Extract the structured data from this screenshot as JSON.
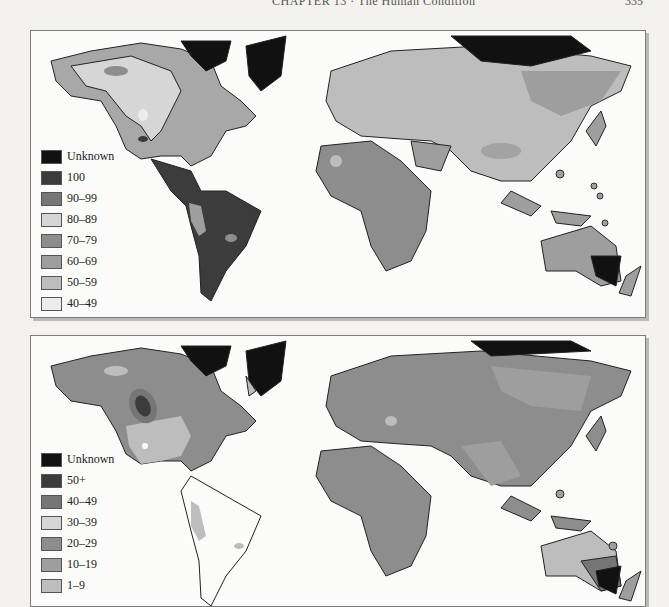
{
  "running_head": {
    "title": "CHAPTER 13 · The Human Condition",
    "page_number": "335"
  },
  "maps": [
    {
      "id": "top",
      "legend": [
        {
          "label": "Unknown",
          "color": "#111111"
        },
        {
          "label": "100",
          "color": "#3c3c3c"
        },
        {
          "label": "90–99",
          "color": "#767676"
        },
        {
          "label": "80–89",
          "color": "#d6d6d6"
        },
        {
          "label": "70–79",
          "color": "#8d8d8d"
        },
        {
          "label": "60–69",
          "color": "#9e9e9e"
        },
        {
          "label": "50–59",
          "color": "#bdbdbd"
        },
        {
          "label": "40–49",
          "color": "#ececec"
        }
      ]
    },
    {
      "id": "bottom",
      "legend": [
        {
          "label": "Unknown",
          "color": "#111111"
        },
        {
          "label": "50+",
          "color": "#3c3c3c"
        },
        {
          "label": "40–49",
          "color": "#767676"
        },
        {
          "label": "30–39",
          "color": "#d6d6d6"
        },
        {
          "label": "20–29",
          "color": "#8d8d8d"
        },
        {
          "label": "10–19",
          "color": "#9e9e9e"
        },
        {
          "label": "1–9",
          "color": "#bdbdbd"
        }
      ]
    }
  ]
}
